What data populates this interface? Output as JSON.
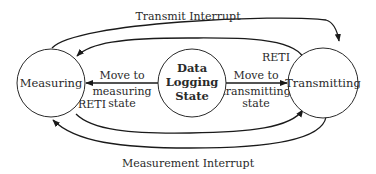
{
  "diagram": {
    "type": "state-transition",
    "nodes": {
      "measuring": {
        "label": "Measuring"
      },
      "logging": {
        "line1": "Data",
        "line2": "Logging",
        "line3": "State"
      },
      "transmitting": {
        "label": "Transmitting"
      }
    },
    "edges": {
      "transmit_interrupt": {
        "label": "Transmit Interrupt",
        "from": "Measuring",
        "to": "Transmitting"
      },
      "reti_top": {
        "label": "RETI",
        "from": "Transmitting",
        "to": "Measuring"
      },
      "move_to_measuring": {
        "line1": "Move to",
        "line2": "measuring",
        "line3": "state",
        "from": "Data Logging State",
        "to": "Measuring"
      },
      "move_to_transmitting": {
        "line1": "Move to",
        "line2": "transmitting",
        "line3": "state",
        "from": "Data Logging State",
        "to": "Transmitting"
      },
      "reti_bottom": {
        "label": "RETI",
        "from": "Measuring",
        "to": "Transmitting"
      },
      "measurement_interrupt": {
        "label": "Measurement Interrupt",
        "from": "Transmitting",
        "to": "Measuring"
      }
    }
  }
}
